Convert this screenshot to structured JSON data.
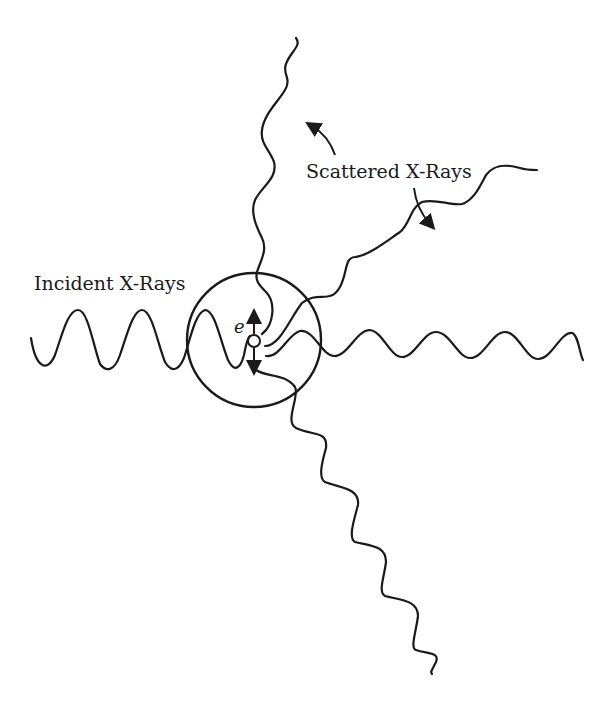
{
  "diagram": {
    "labels": {
      "incident": "Incident X-Rays",
      "scattered": "Scattered X-Rays",
      "electron": "e"
    },
    "colors": {
      "ink": "#1a1a1a",
      "background": "#ffffff"
    },
    "elements": {
      "atom_circle": {
        "cx": 254,
        "cy": 340,
        "r": 67
      },
      "electron": {
        "cx": 254,
        "cy": 341,
        "r": 6
      },
      "oscillation_arrows": [
        "up",
        "down"
      ],
      "waves": [
        {
          "name": "incident-wave",
          "direction": "left-to-right",
          "wavelength": "long"
        },
        {
          "name": "scattered-wave-up",
          "direction": "up"
        },
        {
          "name": "scattered-wave-upper-right",
          "direction": "upper-right"
        },
        {
          "name": "scattered-wave-right",
          "direction": "right"
        },
        {
          "name": "scattered-wave-down",
          "direction": "lower-right"
        }
      ]
    }
  }
}
